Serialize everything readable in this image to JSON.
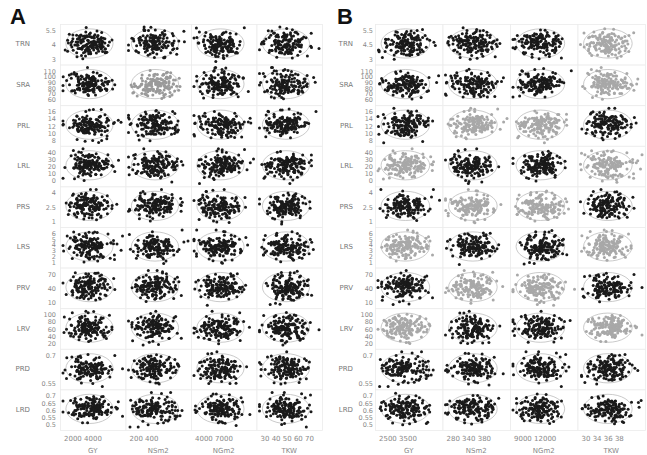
{
  "chart_data": [
    {
      "type": "scatter",
      "title": "A",
      "layout": "scatterplot matrix with 95% density ellipses",
      "rows": [
        "TRN",
        "SRA",
        "PRL",
        "LRL",
        "PRS",
        "LRS",
        "PRV",
        "LRV",
        "PRD",
        "LRD"
      ],
      "columns": [
        "GY",
        "NSm2",
        "NGm2",
        "TKW"
      ],
      "y_ticks": {
        "TRN": [
          "5.5",
          "4",
          "3"
        ],
        "SRA": [
          "110",
          "100",
          "90",
          "80",
          "70",
          "60"
        ],
        "PRL": [
          "16",
          "14",
          "12",
          "10",
          "8"
        ],
        "LRL": [
          "40",
          "30",
          "20",
          "10",
          "0"
        ],
        "PRS": [
          "4",
          "2.5",
          "1"
        ],
        "LRS": [
          "6",
          "5",
          "4",
          "3",
          "2",
          "1"
        ],
        "PRV": [
          "70",
          "40",
          "10"
        ],
        "LRV": [
          "100",
          "80",
          "60",
          "40",
          "20"
        ],
        "PRD": [
          "0.7",
          "0.55"
        ],
        "LRD": [
          "0.7",
          "0.65",
          "0.6",
          "0.55",
          "0.5"
        ]
      },
      "x_ticks": {
        "GY": [
          "2000",
          "4000"
        ],
        "NSm2": [
          "200",
          "400"
        ],
        "NGm2": [
          "4000",
          "7000"
        ],
        "TKW": [
          "30",
          "40",
          "50",
          "60",
          "70"
        ]
      },
      "highlighted_gray_cells": [
        [
          "SRA",
          "NSm2"
        ]
      ],
      "point_color": "#1a1a1a",
      "gray_point_color": "#9a9a9a",
      "ellipse_color": "#bdbdbd",
      "grid_on": true
    },
    {
      "type": "scatter",
      "title": "B",
      "layout": "scatterplot matrix with 95% density ellipses",
      "rows": [
        "TRN",
        "SRA",
        "PRL",
        "LRL",
        "PRS",
        "LRS",
        "PRV",
        "LRV",
        "PRD",
        "LRD"
      ],
      "columns": [
        "GY",
        "NSm2",
        "NGm2",
        "TKW"
      ],
      "y_ticks": {
        "TRN": [
          "5.5",
          "4.5",
          "3"
        ],
        "SRA": [
          "110",
          "100",
          "90",
          "80",
          "70",
          "60"
        ],
        "PRL": [
          "16",
          "14",
          "12",
          "10",
          "8"
        ],
        "LRL": [
          "40",
          "30",
          "20",
          "10",
          "0"
        ],
        "PRS": [
          "4",
          "2.5",
          "1"
        ],
        "LRS": [
          "6",
          "5",
          "4",
          "3",
          "2",
          "1"
        ],
        "PRV": [
          "70",
          "40",
          "10"
        ],
        "LRV": [
          "100",
          "80",
          "60",
          "40",
          "20"
        ],
        "PRD": [
          "0.7",
          "0.55"
        ],
        "LRD": [
          "0.7",
          "0.65",
          "0.6",
          "0.55",
          "0.5"
        ]
      },
      "x_ticks": {
        "GY": [
          "2500",
          "3500"
        ],
        "NSm2": [
          "280",
          "340",
          "380"
        ],
        "NGm2": [
          "9000",
          "12000"
        ],
        "TKW": [
          "30",
          "34",
          "36",
          "38"
        ]
      },
      "highlighted_gray_cells": [
        [
          "TRN",
          "TKW"
        ],
        [
          "SRA",
          "TKW"
        ],
        [
          "PRL",
          "NSm2"
        ],
        [
          "PRL",
          "NGm2"
        ],
        [
          "LRL",
          "GY"
        ],
        [
          "LRL",
          "TKW"
        ],
        [
          "PRS",
          "NSm2"
        ],
        [
          "PRS",
          "NGm2"
        ],
        [
          "LRS",
          "GY"
        ],
        [
          "LRS",
          "TKW"
        ],
        [
          "PRV",
          "NSm2"
        ],
        [
          "PRV",
          "NGm2"
        ],
        [
          "LRV",
          "GY"
        ],
        [
          "LRV",
          "TKW"
        ]
      ],
      "point_color": "#1a1a1a",
      "gray_point_color": "#a8a8a8",
      "ellipse_color": "#bdbdbd",
      "grid_on": true
    }
  ]
}
